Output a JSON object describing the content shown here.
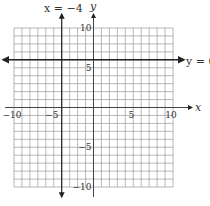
{
  "chart_data": {
    "type": "line",
    "title": "",
    "xlabel": "x",
    "ylabel": "y",
    "xlim": [
      -10,
      10
    ],
    "ylim": [
      -10,
      10
    ],
    "grid": true,
    "grid_step": 1,
    "x_ticks": [
      -10,
      -5,
      5,
      10
    ],
    "y_ticks": [
      10,
      5,
      -5,
      -10
    ],
    "x_tick_labels": [
      "−10",
      "−5",
      "5",
      "10"
    ],
    "y_tick_labels": [
      "10",
      "5",
      "−5",
      "−10"
    ],
    "series": [
      {
        "name": "x = −4",
        "kind": "vertical",
        "value": -4,
        "label": "x = −4"
      },
      {
        "name": "y = 6",
        "kind": "horizontal",
        "value": 6,
        "label": "y = 6"
      }
    ],
    "annotations": [
      "x = −4",
      "y = 6"
    ]
  },
  "labels": {
    "x_axis": "x",
    "y_axis": "y",
    "vline": "x = −4",
    "hline": "y = 6"
  },
  "colors": {
    "grid": "#9a9a9a",
    "axes": "#444444",
    "lines": "#222222",
    "text": "#333333"
  }
}
